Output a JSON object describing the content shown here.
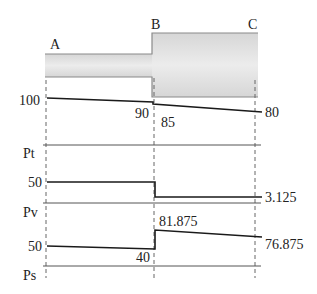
{
  "diagram": {
    "points": [
      {
        "label": "A",
        "x": 46
      },
      {
        "label": "B",
        "x": 154
      },
      {
        "label": "C",
        "x": 255
      }
    ],
    "pipe": {
      "narrow": {
        "x1": 45,
        "x2": 152,
        "y_top": 54,
        "y_bottom": 77
      },
      "wide": {
        "x1": 152,
        "x2": 258,
        "y_top": 33,
        "y_bottom": 97
      },
      "fill_color": "#e4e4e4",
      "edge_color": "#8a8a8a"
    },
    "panels": [
      {
        "name": "Pt",
        "axis_label": "Pt",
        "axis_y": 145,
        "segments": [
          [
            [
              47,
              98
            ],
            [
              153,
              102
            ]
          ],
          [
            [
              153,
              102
            ],
            [
              153,
              104
            ]
          ],
          [
            [
              153,
              104
            ],
            [
              262,
              112
            ]
          ]
        ],
        "labels": [
          {
            "text": "100",
            "x": 40,
            "y": 105,
            "anchor": "end"
          },
          {
            "text": "90",
            "x": 149,
            "y": 118,
            "anchor": "end"
          },
          {
            "text": "85",
            "x": 161,
            "y": 127,
            "anchor": "start"
          },
          {
            "text": "80",
            "x": 265,
            "y": 117,
            "anchor": "start"
          }
        ],
        "values": {
          "A": 100,
          "B_before": 90,
          "B_after": 85,
          "C": 80
        }
      },
      {
        "name": "Pv",
        "axis_label": "Pv",
        "axis_y": 203,
        "segments": [
          [
            [
              47,
              182
            ],
            [
              155,
              182
            ]
          ],
          [
            [
              155,
              182
            ],
            [
              155,
              197
            ]
          ],
          [
            [
              155,
              197
            ],
            [
              262,
              197
            ]
          ]
        ],
        "labels": [
          {
            "text": "50",
            "x": 42,
            "y": 187,
            "anchor": "end"
          },
          {
            "text": "3.125",
            "x": 265,
            "y": 202,
            "anchor": "start"
          }
        ],
        "values": {
          "A": 50,
          "B_before": 50,
          "B_after": 3.125,
          "C": 3.125
        }
      },
      {
        "name": "Ps",
        "axis_label": "Ps",
        "axis_y": 266,
        "segments": [
          [
            [
              47,
              246
            ],
            [
              155,
              249
            ]
          ],
          [
            [
              155,
              249
            ],
            [
              155,
              230
            ]
          ],
          [
            [
              155,
              230
            ],
            [
              262,
              237
            ]
          ]
        ],
        "labels": [
          {
            "text": "50",
            "x": 42,
            "y": 251,
            "anchor": "end"
          },
          {
            "text": "40",
            "x": 150,
            "y": 262,
            "anchor": "end"
          },
          {
            "text": "81.875",
            "x": 159,
            "y": 226,
            "anchor": "start"
          },
          {
            "text": "76.875",
            "x": 265,
            "y": 249,
            "anchor": "start"
          }
        ],
        "values": {
          "A": 50,
          "B_before": 40,
          "B_after": 81.875,
          "C": 76.875
        }
      }
    ],
    "axis_labels_pos": [
      {
        "text": "Pt",
        "x": 23,
        "y": 158
      },
      {
        "text": "Pv",
        "x": 23,
        "y": 217
      },
      {
        "text": "Ps",
        "x": 23,
        "y": 280
      }
    ],
    "point_labels_pos": [
      {
        "text": "A",
        "x": 50,
        "y": 49
      },
      {
        "text": "B",
        "x": 151,
        "y": 29
      },
      {
        "text": "C",
        "x": 248,
        "y": 29
      }
    ],
    "line_color": "#1a1a1a",
    "axis_color": "#555555",
    "dash_color": "#666666"
  }
}
